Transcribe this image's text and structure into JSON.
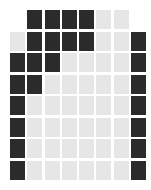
{
  "board": {
    "cols": 8,
    "rows": 8,
    "colors": {
      "dark": "#2b2b2b",
      "light": "#e6e6e6"
    },
    "cells": [
      [
        "_",
        "D",
        "D",
        "D",
        "D",
        "L",
        "L",
        "_"
      ],
      [
        "L",
        "D",
        "D",
        "D",
        "D",
        "L",
        "L",
        "D"
      ],
      [
        "D",
        "D",
        "D",
        "L",
        "L",
        "L",
        "L",
        "D"
      ],
      [
        "D",
        "D",
        "L",
        "L",
        "L",
        "L",
        "L",
        "D"
      ],
      [
        "D",
        "L",
        "L",
        "L",
        "L",
        "L",
        "L",
        "D"
      ],
      [
        "D",
        "L",
        "L",
        "L",
        "L",
        "L",
        "L",
        "D"
      ],
      [
        "D",
        "L",
        "L",
        "L",
        "L",
        "L",
        "L",
        "D"
      ],
      [
        "D",
        "L",
        "L",
        "L",
        "L",
        "L",
        "L",
        "D"
      ]
    ]
  }
}
